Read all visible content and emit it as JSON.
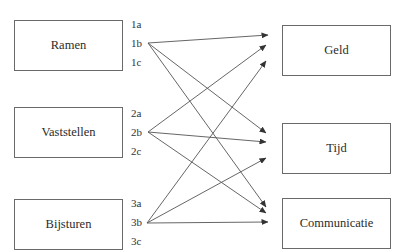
{
  "sources": [
    {
      "label": "Ramen",
      "box": {
        "x": 14,
        "y": 20,
        "w": 109,
        "h": 51
      },
      "subs": [
        {
          "label": "1a",
          "y": 24
        },
        {
          "label": "1b",
          "y": 43
        },
        {
          "label": "1c",
          "y": 62
        }
      ],
      "anchor": {
        "x": 148,
        "y": 43
      }
    },
    {
      "label": "Vaststellen",
      "box": {
        "x": 14,
        "y": 107,
        "w": 109,
        "h": 51
      },
      "subs": [
        {
          "label": "2a",
          "y": 113
        },
        {
          "label": "2b",
          "y": 132
        },
        {
          "label": "2c",
          "y": 151
        }
      ],
      "anchor": {
        "x": 148,
        "y": 132
      }
    },
    {
      "label": "Bijsturen",
      "box": {
        "x": 14,
        "y": 199,
        "w": 109,
        "h": 51
      },
      "subs": [
        {
          "label": "3a",
          "y": 203
        },
        {
          "label": "3b",
          "y": 222
        },
        {
          "label": "3c",
          "y": 241
        }
      ],
      "anchor": {
        "x": 147,
        "y": 223
      }
    }
  ],
  "targets": [
    {
      "label": "Geld",
      "box": {
        "x": 282,
        "y": 25,
        "w": 109,
        "h": 51
      }
    },
    {
      "label": "Tijd",
      "box": {
        "x": 282,
        "y": 123,
        "w": 109,
        "h": 51
      }
    },
    {
      "label": "Communicatie",
      "box": {
        "x": 282,
        "y": 198,
        "w": 109,
        "h": 51
      }
    }
  ],
  "edges": [
    {
      "from": "1b",
      "to": "Geld",
      "x1": 148,
      "y1": 43,
      "x2": 268,
      "y2": 35
    },
    {
      "from": "1b",
      "to": "Tijd",
      "x1": 148,
      "y1": 43,
      "x2": 266,
      "y2": 133
    },
    {
      "from": "1b",
      "to": "Communicatie",
      "x1": 148,
      "y1": 43,
      "x2": 266,
      "y2": 207
    },
    {
      "from": "2b",
      "to": "Geld",
      "x1": 148,
      "y1": 132,
      "x2": 266,
      "y2": 45
    },
    {
      "from": "2b",
      "to": "Tijd",
      "x1": 148,
      "y1": 132,
      "x2": 266,
      "y2": 142
    },
    {
      "from": "2b",
      "to": "Communicatie",
      "x1": 148,
      "y1": 132,
      "x2": 266,
      "y2": 213
    },
    {
      "from": "3b",
      "to": "Geld",
      "x1": 147,
      "y1": 223,
      "x2": 266,
      "y2": 61
    },
    {
      "from": "3b",
      "to": "Tijd",
      "x1": 147,
      "y1": 223,
      "x2": 266,
      "y2": 158
    },
    {
      "from": "3b",
      "to": "Communicatie",
      "x1": 147,
      "y1": 223,
      "x2": 268,
      "y2": 222
    }
  ],
  "colors": {
    "line": "#555555",
    "border": "#6a6a6a",
    "text": "#2b2b2b"
  }
}
